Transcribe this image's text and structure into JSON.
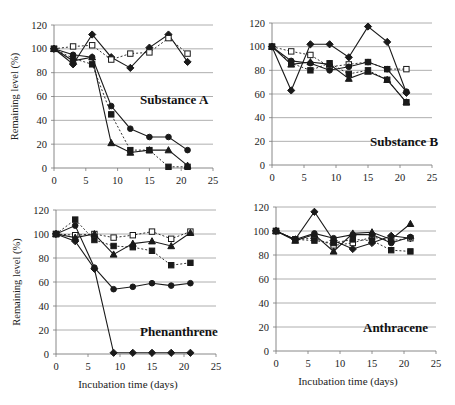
{
  "figure": {
    "ylabel": "Remaining level (%)",
    "xlabel": "Incubation time (days)"
  },
  "chart_data": [
    {
      "type": "line",
      "title": "Substance A",
      "xlabel": "",
      "ylabel": "Remaining level (%)",
      "xlim": [
        0,
        25
      ],
      "ylim": [
        0,
        120
      ],
      "xticks": [
        0,
        5,
        10,
        15,
        20,
        25
      ],
      "yticks": [
        0,
        20,
        40,
        60,
        80,
        100,
        120
      ],
      "grid": "horizontal",
      "layout": {
        "x0": 54,
        "x1": 213,
        "y0": 168,
        "y1": 25,
        "title_x": 140,
        "title_y": 104,
        "show_ylabel": true,
        "show_xlabel": false
      },
      "series": [
        {
          "name": "diamond-solid",
          "marker": "diamond",
          "fill": true,
          "dash": false,
          "x": [
            0,
            3,
            6,
            9,
            12,
            15,
            18,
            21
          ],
          "values": [
            100,
            87,
            112,
            93,
            84,
            101,
            112,
            89
          ]
        },
        {
          "name": "open-square-dotted",
          "marker": "square",
          "fill": false,
          "dash": true,
          "x": [
            0,
            3,
            6,
            9,
            12,
            15,
            18,
            21
          ],
          "values": [
            100,
            102,
            103,
            91,
            96,
            97,
            109,
            96
          ]
        },
        {
          "name": "circle-solid",
          "marker": "circle",
          "fill": true,
          "dash": false,
          "x": [
            0,
            3,
            6,
            9,
            12,
            15,
            18,
            21
          ],
          "values": [
            100,
            95,
            93,
            52,
            33,
            26,
            26,
            15
          ]
        },
        {
          "name": "square-dotted",
          "marker": "square",
          "fill": true,
          "dash": true,
          "x": [
            0,
            3,
            6,
            9,
            12,
            15,
            18,
            21
          ],
          "values": [
            100,
            92,
            87,
            45,
            15,
            15,
            1,
            1
          ]
        },
        {
          "name": "triangle-solid",
          "marker": "triangle",
          "fill": true,
          "dash": false,
          "x": [
            0,
            3,
            6,
            9,
            12,
            15,
            18,
            21
          ],
          "values": [
            100,
            90,
            93,
            21,
            13,
            15,
            15,
            2
          ]
        }
      ]
    },
    {
      "type": "line",
      "title": "Substance B",
      "xlabel": "",
      "ylabel": "",
      "xlim": [
        0,
        25
      ],
      "ylim": [
        0,
        120
      ],
      "xticks": [
        0,
        5,
        10,
        15,
        20,
        25
      ],
      "yticks": [
        0,
        20,
        40,
        60,
        80,
        100,
        120
      ],
      "grid": "horizontal",
      "layout": {
        "x0": 272,
        "x1": 432,
        "y0": 165,
        "y1": 23,
        "title_x": 370,
        "title_y": 146,
        "show_ylabel": false,
        "show_xlabel": false
      },
      "series": [
        {
          "name": "diamond-solid",
          "marker": "diamond",
          "fill": true,
          "dash": false,
          "x": [
            0,
            3,
            6,
            9,
            12,
            15,
            18,
            21
          ],
          "values": [
            100,
            63,
            102,
            102,
            91,
            117,
            104,
            61
          ]
        },
        {
          "name": "open-square-dotted",
          "marker": "square",
          "fill": false,
          "dash": true,
          "x": [
            0,
            3,
            6,
            9,
            12,
            15,
            18,
            21
          ],
          "values": [
            100,
            96,
            93,
            83,
            85,
            87,
            81,
            81
          ]
        },
        {
          "name": "circle-solid",
          "marker": "circle",
          "fill": true,
          "dash": false,
          "x": [
            0,
            3,
            6,
            9,
            12,
            15,
            18,
            21
          ],
          "values": [
            100,
            88,
            86,
            80,
            83,
            87,
            81,
            62
          ]
        },
        {
          "name": "square-dotted",
          "marker": "square",
          "fill": true,
          "dash": true,
          "x": [
            0,
            3,
            6,
            9,
            12,
            15,
            18,
            21
          ],
          "values": [
            100,
            86,
            80,
            86,
            77,
            80,
            72,
            53
          ]
        },
        {
          "name": "triangle-solid",
          "marker": "triangle",
          "fill": true,
          "dash": false,
          "x": [
            0,
            3,
            6,
            9,
            12,
            15,
            18,
            21
          ],
          "values": [
            100,
            85,
            87,
            85,
            73,
            79,
            72,
            53
          ]
        }
      ]
    },
    {
      "type": "line",
      "title": "Phenanthrene",
      "xlabel": "Incubation time (days)",
      "ylabel": "Remaining level (%)",
      "xlim": [
        0,
        25
      ],
      "ylim": [
        0,
        120
      ],
      "xticks": [
        0,
        5,
        10,
        15,
        20,
        25
      ],
      "yticks": [
        0,
        20,
        40,
        60,
        80,
        100,
        120
      ],
      "grid": "horizontal",
      "layout": {
        "x0": 56,
        "x1": 216,
        "y0": 354,
        "y1": 210,
        "title_x": 140,
        "title_y": 336,
        "show_ylabel": true,
        "show_xlabel": true
      },
      "series": [
        {
          "name": "diamond-solid",
          "marker": "diamond",
          "fill": true,
          "dash": false,
          "x": [
            0,
            3,
            6,
            9,
            12,
            15,
            18,
            21
          ],
          "values": [
            100,
            94,
            71,
            1,
            1,
            1,
            1,
            1
          ]
        },
        {
          "name": "open-square-dotted",
          "marker": "square",
          "fill": false,
          "dash": true,
          "x": [
            0,
            3,
            6,
            9,
            12,
            15,
            18,
            21
          ],
          "values": [
            100,
            99,
            100,
            97,
            99,
            102,
            96,
            102
          ]
        },
        {
          "name": "circle-solid",
          "marker": "circle",
          "fill": true,
          "dash": false,
          "x": [
            0,
            3,
            6,
            9,
            12,
            15,
            18,
            21
          ],
          "values": [
            100,
            107,
            72,
            54,
            56,
            59,
            57,
            59
          ]
        },
        {
          "name": "square-dotted",
          "marker": "square",
          "fill": true,
          "dash": true,
          "x": [
            0,
            3,
            6,
            9,
            12,
            15,
            18,
            21
          ],
          "values": [
            100,
            112,
            95,
            90,
            89,
            86,
            74,
            76
          ]
        },
        {
          "name": "triangle-solid",
          "marker": "triangle",
          "fill": true,
          "dash": false,
          "x": [
            0,
            3,
            6,
            9,
            12,
            15,
            18,
            21
          ],
          "values": [
            100,
            97,
            100,
            83,
            92,
            94,
            90,
            101
          ]
        }
      ]
    },
    {
      "type": "line",
      "title": "Anthracene",
      "xlabel": "Incubation time (days)",
      "ylabel": "",
      "xlim": [
        0,
        25
      ],
      "ylim": [
        0,
        120
      ],
      "xticks": [
        0,
        5,
        10,
        15,
        20,
        25
      ],
      "yticks": [
        0,
        20,
        40,
        60,
        80,
        100,
        120
      ],
      "grid": "horizontal",
      "layout": {
        "x0": 276,
        "x1": 436,
        "y0": 351,
        "y1": 207,
        "title_x": 363,
        "title_y": 332,
        "show_ylabel": false,
        "show_xlabel": true
      },
      "series": [
        {
          "name": "diamond-solid",
          "marker": "diamond",
          "fill": true,
          "dash": false,
          "x": [
            0,
            3,
            6,
            9,
            12,
            15,
            18,
            21
          ],
          "values": [
            100,
            93,
            116,
            92,
            85,
            90,
            96,
            94
          ]
        },
        {
          "name": "open-square-dotted",
          "marker": "square",
          "fill": false,
          "dash": true,
          "x": [
            0,
            3,
            6,
            9,
            12,
            15,
            18,
            21
          ],
          "values": [
            100,
            93,
            94,
            88,
            90,
            95,
            92,
            94
          ]
        },
        {
          "name": "circle-solid",
          "marker": "circle",
          "fill": true,
          "dash": false,
          "x": [
            0,
            3,
            6,
            9,
            12,
            15,
            18,
            21
          ],
          "values": [
            100,
            93,
            98,
            94,
            97,
            97,
            90,
            95
          ]
        },
        {
          "name": "square-dotted",
          "marker": "square",
          "fill": true,
          "dash": true,
          "x": [
            0,
            3,
            6,
            9,
            12,
            15,
            18,
            21
          ],
          "values": [
            100,
            93,
            92,
            90,
            93,
            92,
            84,
            83
          ]
        },
        {
          "name": "triangle-solid",
          "marker": "triangle",
          "fill": true,
          "dash": false,
          "x": [
            0,
            3,
            6,
            9,
            12,
            15,
            18,
            21
          ],
          "values": [
            100,
            92,
            97,
            83,
            98,
            99,
            93,
            106
          ]
        }
      ]
    }
  ],
  "style": {
    "line_color": "#1a1a1a",
    "grid_color": "#9a9a9a",
    "axis_color": "#7a7a7a",
    "background": "#ffffff"
  }
}
